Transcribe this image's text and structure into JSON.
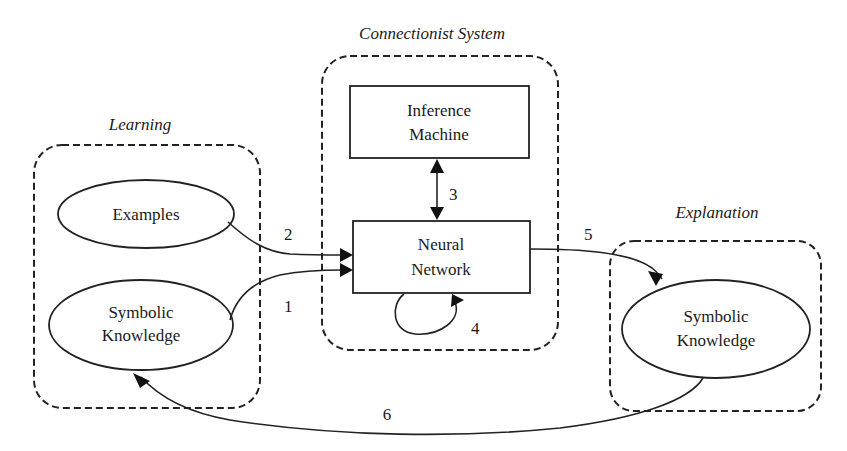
{
  "groups": {
    "learning": {
      "title": "Learning"
    },
    "connectionist": {
      "title": "Connectionist System"
    },
    "explanation": {
      "title": "Explanation"
    }
  },
  "nodes": {
    "examples": {
      "line1": "Examples"
    },
    "symbolic_knowledge_in": {
      "line1": "Symbolic",
      "line2": "Knowledge"
    },
    "inference_machine": {
      "line1": "Inference",
      "line2": "Machine"
    },
    "neural_network": {
      "line1": "Neural",
      "line2": "Network"
    },
    "symbolic_knowledge_out": {
      "line1": "Symbolic",
      "line2": "Knowledge"
    }
  },
  "edges": [
    {
      "id": "1",
      "label": "1",
      "from": "Symbolic Knowledge (Learning)",
      "to": "Neural Network"
    },
    {
      "id": "2",
      "label": "2",
      "from": "Examples",
      "to": "Neural Network"
    },
    {
      "id": "3",
      "label": "3",
      "from": "Inference Machine",
      "to": "Neural Network",
      "bidirectional": true
    },
    {
      "id": "4",
      "label": "4",
      "from": "Neural Network",
      "to": "Neural Network",
      "self_loop": true
    },
    {
      "id": "5",
      "label": "5",
      "from": "Neural Network",
      "to": "Symbolic Knowledge (Explanation)"
    },
    {
      "id": "6",
      "label": "6",
      "from": "Symbolic Knowledge (Explanation)",
      "to": "Symbolic Knowledge (Learning)"
    }
  ]
}
